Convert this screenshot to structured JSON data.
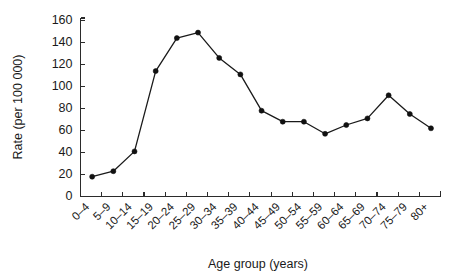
{
  "chart_data": {
    "type": "line",
    "title": "",
    "xlabel": "Age group (years)",
    "ylabel": "Rate (per 100 000)",
    "categories": [
      "0–4",
      "5–9",
      "10–14",
      "15–19",
      "20–24",
      "25–29",
      "30–34",
      "35–39",
      "40–44",
      "45–49",
      "50–54",
      "55–59",
      "60–64",
      "65–69",
      "70–74",
      "75–79",
      "80+"
    ],
    "values": [
      18,
      23,
      41,
      114,
      144,
      149,
      126,
      111,
      78,
      68,
      68,
      57,
      65,
      71,
      92,
      75,
      62
    ],
    "series": [
      {
        "name": "Rate",
        "values": [
          18,
          23,
          41,
          114,
          144,
          149,
          126,
          111,
          78,
          68,
          68,
          57,
          65,
          71,
          92,
          75,
          62
        ]
      }
    ],
    "yticks": [
      0,
      20,
      40,
      60,
      80,
      100,
      120,
      140,
      160
    ],
    "ylim": [
      0,
      160
    ],
    "grid": false,
    "legend": false,
    "legend_position": "none",
    "marker": "filled-circle",
    "line_color": "#1a1a1a",
    "marker_color": "#111111",
    "background_color": "#ffffff"
  }
}
